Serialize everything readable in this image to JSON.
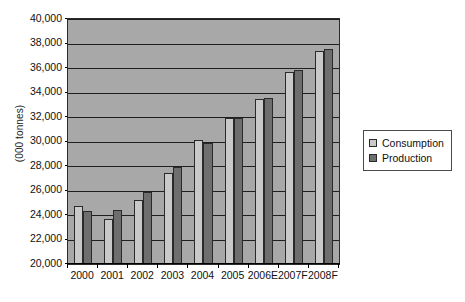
{
  "chart_data": {
    "type": "bar",
    "title": "",
    "xlabel": "",
    "ylabel": "(000 tonnes)",
    "ylim": [
      20000,
      40000
    ],
    "ytick_step": 2000,
    "ytick_labels": [
      "20,000",
      "22,000",
      "24,000",
      "26,000",
      "28,000",
      "30,000",
      "32,000",
      "34,000",
      "36,000",
      "38,000",
      "40,000"
    ],
    "grid": true,
    "grid_orientation": "horizontal",
    "legend_position": "right",
    "categories": [
      "2000",
      "2001",
      "2002",
      "2003",
      "2004",
      "2005",
      "2006E",
      "2007F",
      "2008F"
    ],
    "series": [
      {
        "name": "Consumption",
        "color": "#c9c9c9",
        "values": [
          24700,
          23650,
          25250,
          27450,
          30150,
          31950,
          33500,
          35650,
          37400
        ]
      },
      {
        "name": "Production",
        "color": "#6e6e6e",
        "values": [
          24300,
          24400,
          25900,
          27900,
          29900,
          31950,
          33550,
          35850,
          37550
        ]
      }
    ]
  },
  "legend": {
    "items": [
      {
        "label": "Consumption",
        "swatch": "consumption"
      },
      {
        "label": "Production",
        "swatch": "production"
      }
    ]
  },
  "caption": {
    "text": ""
  },
  "colors": {
    "plot_background": "#a8a8a8",
    "gridline": "#1f1f1f",
    "axis": "#000000",
    "consumption": "#c9c9c9",
    "production": "#6e6e6e",
    "page_background": "#ffffff"
  }
}
